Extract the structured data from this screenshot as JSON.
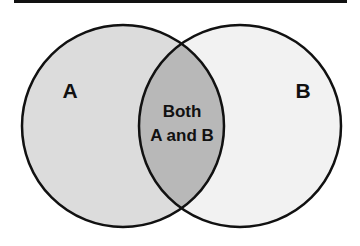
{
  "diagram": {
    "type": "venn",
    "sets": [
      {
        "id": "A",
        "label": "A",
        "fill": "#dcdcdc"
      },
      {
        "id": "B",
        "label": "B",
        "fill": "#f2f2f2"
      }
    ],
    "intersection": {
      "label_line1": "Both",
      "label_line2": "A and B",
      "fill": "#b8b8b8"
    },
    "stroke_color": "#111111",
    "top_rule_color": "#111111"
  }
}
